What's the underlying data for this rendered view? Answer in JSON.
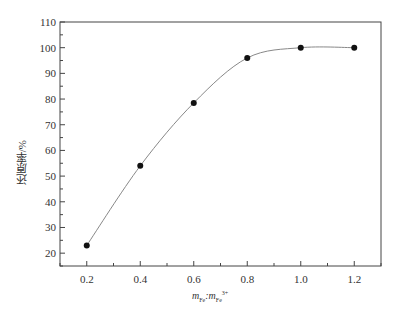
{
  "chart_data": {
    "type": "line",
    "title": "",
    "xlabel": "m_Fe:m_Fe3+",
    "ylabel": "还原率/%",
    "x": [
      0.2,
      0.4,
      0.6,
      0.8,
      1.0,
      1.2
    ],
    "series": [
      {
        "name": "还原率",
        "values": [
          23,
          54,
          78.5,
          96,
          100,
          100
        ],
        "marker": "circle",
        "line": "smooth"
      }
    ],
    "xlim": [
      0.1,
      1.3
    ],
    "ylim": [
      15,
      110
    ],
    "xticks": [
      "0.2",
      "0.4",
      "0.6",
      "0.8",
      "1.0",
      "1.2"
    ],
    "yticks": [
      "20",
      "30",
      "40",
      "50",
      "60",
      "70",
      "80",
      "90",
      "100",
      "110"
    ],
    "grid": false,
    "legend": null
  },
  "labels": {
    "ylabel": "还原率/%",
    "xlabel_m1": "m",
    "xlabel_sub1": "Fe",
    "xlabel_sep": ":",
    "xlabel_m2": "m",
    "xlabel_sub2": "Fe",
    "xlabel_sup2": "3+"
  }
}
